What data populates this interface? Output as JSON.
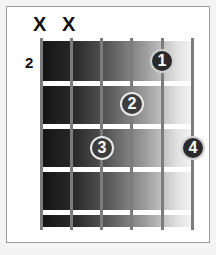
{
  "diagram": {
    "type": "guitar-chord-chart",
    "strings": 6,
    "frets_shown": 4,
    "start_fret_label": "2",
    "muted_strings": [
      {
        "string": 6,
        "symbol": "X"
      },
      {
        "string": 5,
        "symbol": "X"
      }
    ],
    "fingers": [
      {
        "finger": "1",
        "string": 2,
        "fret": 1
      },
      {
        "finger": "2",
        "string": 3,
        "fret": 2
      },
      {
        "finger": "3",
        "string": 4,
        "fret": 3
      },
      {
        "finger": "4",
        "string": 1,
        "fret": 3
      }
    ]
  }
}
